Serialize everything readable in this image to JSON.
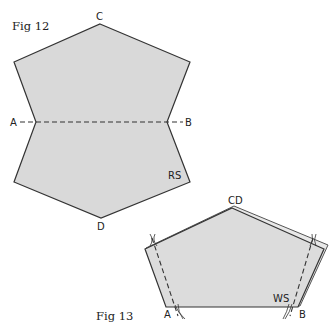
{
  "fig12": {
    "caption": "Fig 12",
    "labels": {
      "top": "C",
      "left": "A",
      "right": "B",
      "bottom": "D",
      "side": "RS"
    },
    "fill": "#d9d9d9",
    "stroke": "#333333"
  },
  "fig13": {
    "caption": "Fig 13",
    "labels": {
      "apex": "CD",
      "left": "A",
      "right": "B",
      "side": "WS"
    },
    "fill": "#dcdcdc",
    "stroke": "#333333"
  }
}
